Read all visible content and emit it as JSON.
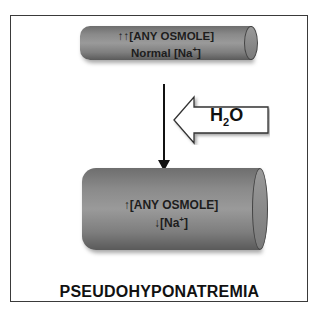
{
  "diagram": {
    "title": "PSEUDOHYPONATREMIA",
    "top_cylinder": {
      "line1": "↑↑[ANY OSMOLE]",
      "line2_prefix": "Normal [Na",
      "line2_sup": "+",
      "line2_suffix": "]"
    },
    "bottom_cylinder": {
      "line1": "↑[ANY OSMOLE]",
      "line2_prefix": "↓[Na",
      "line2_sup": "+",
      "line2_suffix": "]"
    },
    "water_arrow": {
      "label_main": "H",
      "label_sub": "2",
      "label_end": "O",
      "direction": "left"
    },
    "flow_arrow": {
      "direction": "down"
    }
  }
}
